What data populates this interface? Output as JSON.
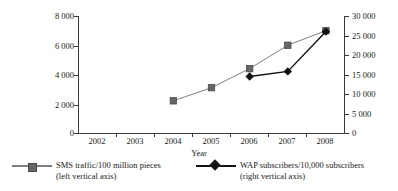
{
  "chart_data": {
    "type": "line",
    "title": "",
    "xlabel": "Year",
    "ylabel": "",
    "categories": [
      "2002",
      "2003",
      "2004",
      "2005",
      "2006",
      "2007",
      "2008"
    ],
    "grid": false,
    "legend_position": "bottom",
    "axes": {
      "left": {
        "ylim": [
          0,
          8000
        ],
        "ticks": [
          0,
          2000,
          4000,
          6000,
          8000
        ],
        "tick_labels": [
          "0",
          "2 000",
          "4 000",
          "6 000",
          "8 000"
        ]
      },
      "right": {
        "ylim": [
          0,
          30000
        ],
        "ticks": [
          0,
          5000,
          10000,
          15000,
          20000,
          25000,
          30000
        ],
        "tick_labels": [
          "0",
          "5 000",
          "10 000",
          "15 000",
          "20 000",
          "25 000",
          "30 000"
        ]
      }
    },
    "series": [
      {
        "name": "SMS traffic/100 million pieces",
        "axis": "left",
        "marker": "square",
        "color": "#666666",
        "line_color": "#808080",
        "x": [
          "2004",
          "2005",
          "2006",
          "2007",
          "2008"
        ],
        "values": [
          2200,
          3100,
          4400,
          6000,
          7000
        ]
      },
      {
        "name": "WAP subscribers/10,000 subscribers",
        "axis": "right",
        "marker": "diamond",
        "color": "#111111",
        "line_color": "#111111",
        "x": [
          "2006",
          "2007",
          "2008"
        ],
        "values": [
          14500,
          15800,
          26000
        ]
      }
    ]
  },
  "legend": {
    "sms": {
      "label": "SMS traffic/100 million pieces",
      "sub": "(left vertical axis)",
      "marker": "square-marker-icon",
      "color": "#666666"
    },
    "wap": {
      "label": "WAP subscribers/10,000 subscribers",
      "sub": "(right vertical axis)",
      "marker": "diamond-marker-icon",
      "color": "#111111"
    }
  },
  "axis_titles": {
    "x": "Year"
  }
}
